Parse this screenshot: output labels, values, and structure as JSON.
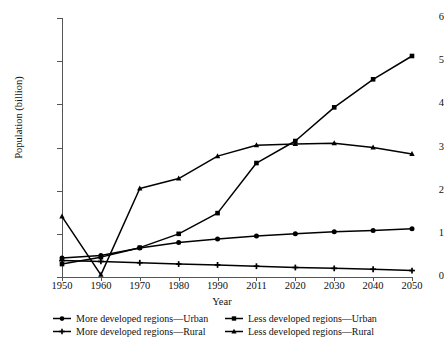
{
  "chart_data": {
    "type": "line",
    "title": "",
    "xlabel": "Year",
    "ylabel": "Population (billion)",
    "x": [
      1950,
      1960,
      1970,
      1980,
      1990,
      2011,
      2020,
      2030,
      2040,
      2050
    ],
    "categories": [
      "1950",
      "1960",
      "1970",
      "1980",
      "1990",
      "2011",
      "2020",
      "2030",
      "2040",
      "2050"
    ],
    "xtick_labels": [
      "1950",
      "1960",
      "1970",
      "1980",
      "1990",
      "2011",
      "2020",
      "2030",
      "2040",
      "2050"
    ],
    "ytick_labels": [
      "0",
      "1",
      "2",
      "3",
      "4",
      "5",
      "6"
    ],
    "ytick_values": [
      0,
      1,
      2,
      3,
      4,
      5,
      6
    ],
    "ylim": [
      0,
      6
    ],
    "xlim": [
      1950,
      2050
    ],
    "grid": false,
    "legend_position": "below",
    "series": [
      {
        "name": "More developed regions—Urban",
        "marker": "circle",
        "color": "#000000",
        "values": [
          0.44,
          0.5,
          0.67,
          0.8,
          0.88,
          0.95,
          1.0,
          1.05,
          1.08,
          1.12
        ]
      },
      {
        "name": "More developed regions—Rural",
        "marker": "plus",
        "color": "#000000",
        "values": [
          0.38,
          0.36,
          0.33,
          0.3,
          0.28,
          0.25,
          0.22,
          0.2,
          0.18,
          0.15
        ]
      },
      {
        "name": "Less developed regions—Urban",
        "marker": "square",
        "color": "#000000",
        "values": [
          0.3,
          0.46,
          0.68,
          1.0,
          1.48,
          2.64,
          3.15,
          3.93,
          4.58,
          5.12
        ]
      },
      {
        "name": "Less developed regions—Rural",
        "marker": "triangle",
        "color": "#000000",
        "values": [
          1.4,
          0.05,
          2.05,
          2.28,
          2.8,
          3.05,
          3.08,
          3.1,
          3.0,
          2.85
        ]
      }
    ]
  },
  "legend": {
    "items": [
      {
        "label": "More developed regions—Urban",
        "marker": "circle"
      },
      {
        "label": "Less developed regions—Urban",
        "marker": "square"
      },
      {
        "label": "More developed regions—Rural",
        "marker": "plus"
      },
      {
        "label": "Less developed regions—Rural",
        "marker": "triangle"
      }
    ]
  }
}
